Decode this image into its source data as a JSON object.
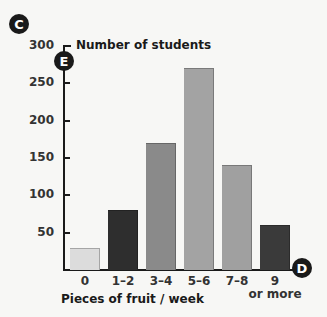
{
  "chart_data": {
    "type": "bar",
    "title": "",
    "ylabel": "Number of students",
    "xlabel": "Pieces of fruit / week",
    "categories": [
      "0",
      "1–2",
      "3–4",
      "5–6",
      "7–8",
      "9\nor more"
    ],
    "category_labels": [
      {
        "line1": "0",
        "line2": ""
      },
      {
        "line1": "1–2",
        "line2": ""
      },
      {
        "line1": "3–4",
        "line2": ""
      },
      {
        "line1": "5–6",
        "line2": ""
      },
      {
        "line1": "7–8",
        "line2": ""
      },
      {
        "line1": "9",
        "line2": "or more"
      }
    ],
    "values": [
      30,
      80,
      170,
      270,
      140,
      60
    ],
    "bar_colors": [
      "#dcdcdc",
      "#2e2e2e",
      "#8a8a8a",
      "#a3a3a3",
      "#a0a0a0",
      "#3a3a3a"
    ],
    "yticks": [
      50,
      100,
      150,
      200,
      250,
      300
    ],
    "ylim": [
      0,
      300
    ],
    "grid": false,
    "legend": "none"
  },
  "markers": {
    "c": "C",
    "d": "D",
    "e": "E"
  }
}
